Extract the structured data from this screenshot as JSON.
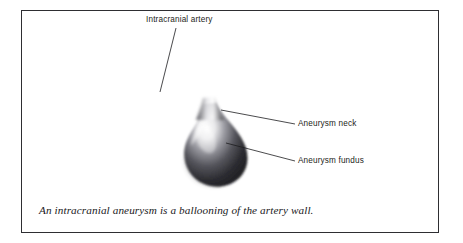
{
  "figure": {
    "background_color": "#ffffff",
    "border_color": "#2e2e32",
    "ink_color": "#1d1d20",
    "caption": "An intracranial aneurysm is a ballooning of the artery wall.",
    "labels": {
      "artery": "Intracranial artery",
      "neck": "Aneurysm neck",
      "fundus": "Aneurysm fundus"
    },
    "structures": {
      "artery_name": "intracranial-artery",
      "neck_name": "aneurysm-neck",
      "fundus_name": "aneurysm-fundus"
    }
  }
}
